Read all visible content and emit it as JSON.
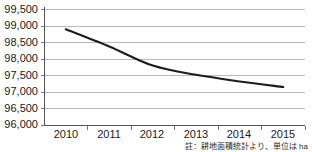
{
  "chart_data": {
    "type": "line",
    "title": "",
    "subtitle": "",
    "xlabel": "",
    "ylabel": "",
    "categories": [
      "2010",
      "2011",
      "2012",
      "2013",
      "2014",
      "2015"
    ],
    "series": [
      {
        "name": "耕地面積",
        "values": [
          98900,
          98380,
          97800,
          97520,
          97320,
          97150
        ]
      }
    ],
    "ylim": [
      96000,
      99500
    ],
    "ytick_values": [
      96000,
      96500,
      97000,
      97500,
      98000,
      98500,
      99000,
      99500
    ],
    "ytick_labels": [
      "96,000",
      "96,500",
      "97,000",
      "97,500",
      "98,000",
      "98,500",
      "99,000",
      "99,500"
    ],
    "grid": "horizontal",
    "legend": "none",
    "line_color": "#1c1c1c",
    "grid_color": "#b8b8b8",
    "axis_color": "#555555"
  },
  "footnote": {
    "text": "註：耕地面積統計より、単位は ha"
  }
}
